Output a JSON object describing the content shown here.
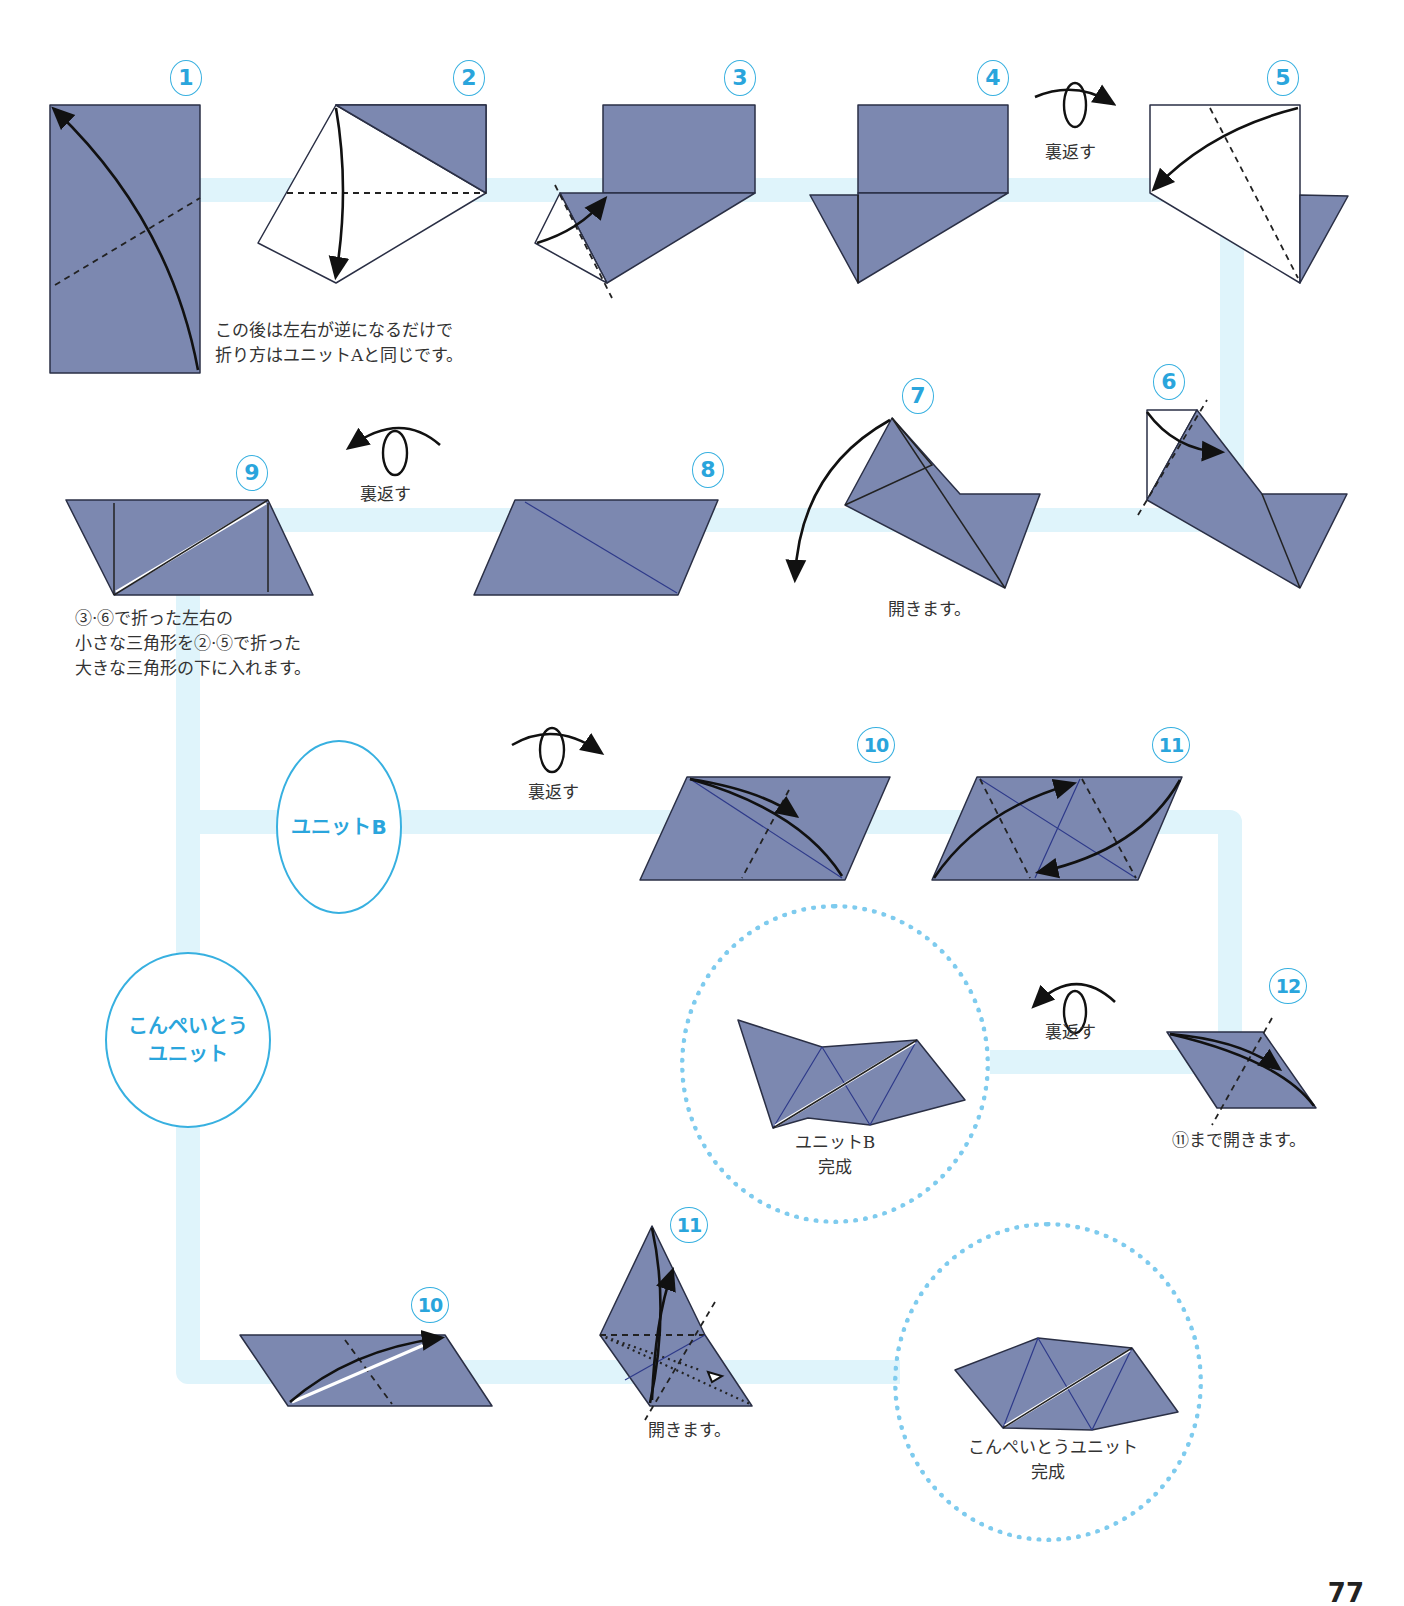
{
  "steps": {
    "s1": "1",
    "s2": "2",
    "s3": "3",
    "s4": "4",
    "s5": "5",
    "s6": "6",
    "s7": "7",
    "s8": "8",
    "s9": "9",
    "b10": "10",
    "b11": "11",
    "b12": "12",
    "k10": "10",
    "k11": "11"
  },
  "notes": {
    "reverse_note_line1": "この後は左右が逆になるだけで",
    "reverse_note_line2": "折り方はユニットAと同じです。",
    "flip_1": "裏返す",
    "flip_2": "裏返す",
    "flip_3": "裏返す",
    "flip_4": "裏返す",
    "open_7": "開きます。",
    "step9_line1": "③·⑥で折った左右の",
    "step9_line2": "小さな三角形を②·⑤で折った",
    "step9_line3": "大きな三角形の下に入れます。",
    "open_to_11": "⑪まで開きます。",
    "open_k11": "開きます。"
  },
  "units": {
    "unit_b": "ユニットB",
    "konpeito_line1": "こんぺいとう",
    "konpeito_line2": "ユニット"
  },
  "completions": {
    "unit_b_line1": "ユニットB",
    "unit_b_line2": "完成",
    "konpeito_line1": "こんぺいとうユニット",
    "konpeito_line2": "完成"
  },
  "page": {
    "number": "77"
  },
  "colors": {
    "paper": "#7c88b0",
    "accent_blue": "#2aa5dc",
    "connector": "#dff4fb",
    "dotted_ring": "#7ecbee"
  }
}
